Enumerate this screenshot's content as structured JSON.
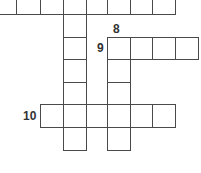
{
  "puzzle": {
    "type": "crossword",
    "line_color": "#4a4a4a",
    "cells": [
      {
        "x": -8,
        "y": -9,
        "w": 25,
        "h": 24
      },
      {
        "x": 16,
        "y": -9,
        "w": 25,
        "h": 24
      },
      {
        "x": 40,
        "y": -9,
        "w": 24,
        "h": 24
      },
      {
        "x": 63,
        "y": -9,
        "w": 24,
        "h": 24
      },
      {
        "x": 86,
        "y": -9,
        "w": 22,
        "h": 24
      },
      {
        "x": 107,
        "y": -9,
        "w": 24,
        "h": 24
      },
      {
        "x": 130,
        "y": -9,
        "w": 23,
        "h": 24
      },
      {
        "x": 152,
        "y": -9,
        "w": 24,
        "h": 24
      },
      {
        "x": 63,
        "y": 14,
        "w": 24,
        "h": 24
      },
      {
        "x": 63,
        "y": 37,
        "w": 24,
        "h": 23
      },
      {
        "x": 63,
        "y": 59,
        "w": 24,
        "h": 24
      },
      {
        "x": 63,
        "y": 82,
        "w": 24,
        "h": 23
      },
      {
        "x": 107,
        "y": 37,
        "w": 24,
        "h": 23
      },
      {
        "x": 130,
        "y": 37,
        "w": 23,
        "h": 23
      },
      {
        "x": 152,
        "y": 37,
        "w": 24,
        "h": 23
      },
      {
        "x": 175,
        "y": 37,
        "w": 24,
        "h": 23
      },
      {
        "x": 107,
        "y": 59,
        "w": 24,
        "h": 24
      },
      {
        "x": 107,
        "y": 82,
        "w": 24,
        "h": 23
      },
      {
        "x": 40,
        "y": 104,
        "w": 24,
        "h": 24
      },
      {
        "x": 63,
        "y": 104,
        "w": 24,
        "h": 24
      },
      {
        "x": 86,
        "y": 104,
        "w": 22,
        "h": 24
      },
      {
        "x": 107,
        "y": 104,
        "w": 24,
        "h": 24
      },
      {
        "x": 130,
        "y": 104,
        "w": 23,
        "h": 24
      },
      {
        "x": 152,
        "y": 104,
        "w": 24,
        "h": 24
      },
      {
        "x": 63,
        "y": 127,
        "w": 24,
        "h": 24
      },
      {
        "x": 107,
        "y": 127,
        "w": 24,
        "h": 24
      }
    ],
    "clue_numbers": [
      {
        "label": "8",
        "x": 113,
        "y": 23
      },
      {
        "label": "9",
        "x": 97,
        "y": 42
      },
      {
        "label": "10",
        "x": 23,
        "y": 110
      }
    ]
  }
}
